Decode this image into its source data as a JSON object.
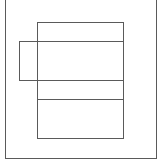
{
  "diagram": {
    "type": "layout-wireframe",
    "line_color": "#5a5a5a",
    "background": "#ffffff",
    "outer_frame": {
      "x": 5,
      "y": 0,
      "w": 152,
      "h": 159,
      "top_border": false
    },
    "main_column": {
      "x": 37,
      "y": 22,
      "w": 87,
      "h": 117
    },
    "dividers_y": [
      42,
      80,
      99
    ],
    "side_box": {
      "x": 19,
      "y": 41,
      "w": 19,
      "h": 40
    }
  }
}
